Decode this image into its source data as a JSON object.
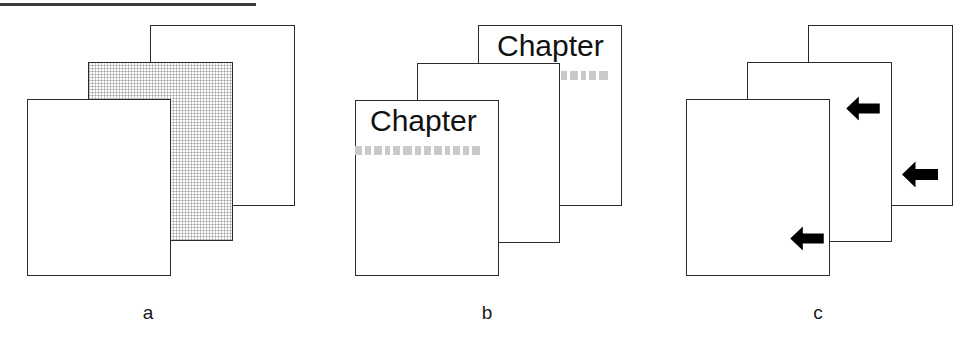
{
  "figure": {
    "width": 974,
    "height": 345,
    "background": "#ffffff",
    "line_color": "#2b2b2b",
    "text_block_color": "#c9c9c9",
    "arrow_color": "#000000",
    "top_rule": {
      "x": 0,
      "y": 3,
      "width": 256,
      "height": 3,
      "color": "#3a3a3a"
    }
  },
  "panels": [
    {
      "id": "a",
      "caption": "a",
      "caption_x": 148,
      "caption_y": 303,
      "sheets": [
        {
          "role": "back",
          "x": 150,
          "y": 25,
          "width": 145,
          "height": 181,
          "fill": "plain"
        },
        {
          "role": "middle",
          "x": 88,
          "y": 62,
          "width": 145,
          "height": 179,
          "fill": "hatched"
        },
        {
          "role": "front",
          "x": 27,
          "y": 99,
          "width": 144,
          "height": 177,
          "fill": "plain"
        }
      ]
    },
    {
      "id": "b",
      "caption": "b",
      "caption_x": 487,
      "caption_y": 303,
      "sheets": [
        {
          "role": "back",
          "x": 478,
          "y": 25,
          "width": 144,
          "height": 181,
          "fill": "plain",
          "heading": "Chapter",
          "heading_x": 497,
          "heading_y": 31,
          "heading_size": 30,
          "blocks_x": 551,
          "blocks_y": 71,
          "blocks_w": 72,
          "blocks_h": 9,
          "blocks_count": 6
        },
        {
          "role": "middle",
          "x": 417,
          "y": 63,
          "width": 143,
          "height": 180,
          "fill": "plain"
        },
        {
          "role": "front",
          "x": 355,
          "y": 100,
          "width": 144,
          "height": 176,
          "fill": "plain",
          "heading": "Chapter",
          "heading_x": 370,
          "heading_y": 106,
          "heading_size": 30,
          "blocks_x": 355,
          "blocks_y": 146,
          "blocks_w": 144,
          "blocks_h": 9,
          "blocks_count": 13
        }
      ]
    },
    {
      "id": "c",
      "caption": "c",
      "caption_x": 818,
      "caption_y": 303,
      "sheets": [
        {
          "role": "back",
          "x": 808,
          "y": 25,
          "width": 145,
          "height": 181,
          "fill": "plain",
          "arrow": {
            "x": 902,
            "y": 160,
            "width": 36,
            "height": 29
          }
        },
        {
          "role": "middle",
          "x": 747,
          "y": 62,
          "width": 145,
          "height": 180,
          "fill": "plain",
          "arrow": {
            "x": 846,
            "y": 95,
            "width": 34,
            "height": 27
          }
        },
        {
          "role": "front",
          "x": 686,
          "y": 99,
          "width": 144,
          "height": 177,
          "fill": "plain",
          "arrow": {
            "x": 790,
            "y": 225,
            "width": 34,
            "height": 27
          }
        }
      ]
    }
  ]
}
